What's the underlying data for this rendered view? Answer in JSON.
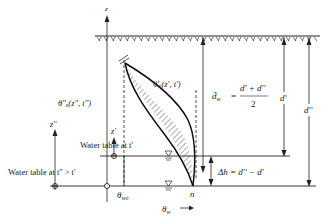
{
  "diagram": {
    "axes": {
      "z_label": "z",
      "z2_label": "z''",
      "z1_label": "z'",
      "theta_label": "θ",
      "theta_sub": "w",
      "theta_arrow": "→"
    },
    "curves": {
      "theta_double_prime": "θ''ᵤ(z'', t'')",
      "theta_prime": "θ'ᵤ(z', t')"
    },
    "labels": {
      "d_bar_lhs": "d̄",
      "d_bar_sub": "w",
      "d_bar_eq": "=",
      "d_bar_numerator": "d' + d''",
      "d_bar_denominator": "2",
      "d_prime": "d'",
      "d_double_prime": "d''",
      "water_table_t1": "Water table at t'",
      "water_table_t2": "Water table at t'' > t'",
      "theta_wo": "θ",
      "theta_wo_sub": "wo",
      "delta_h": "Δh = d'' − d'",
      "n_label": "n"
    },
    "colors": {
      "line": "#222222",
      "hatch": "#333333",
      "background": "#ffffff"
    }
  }
}
